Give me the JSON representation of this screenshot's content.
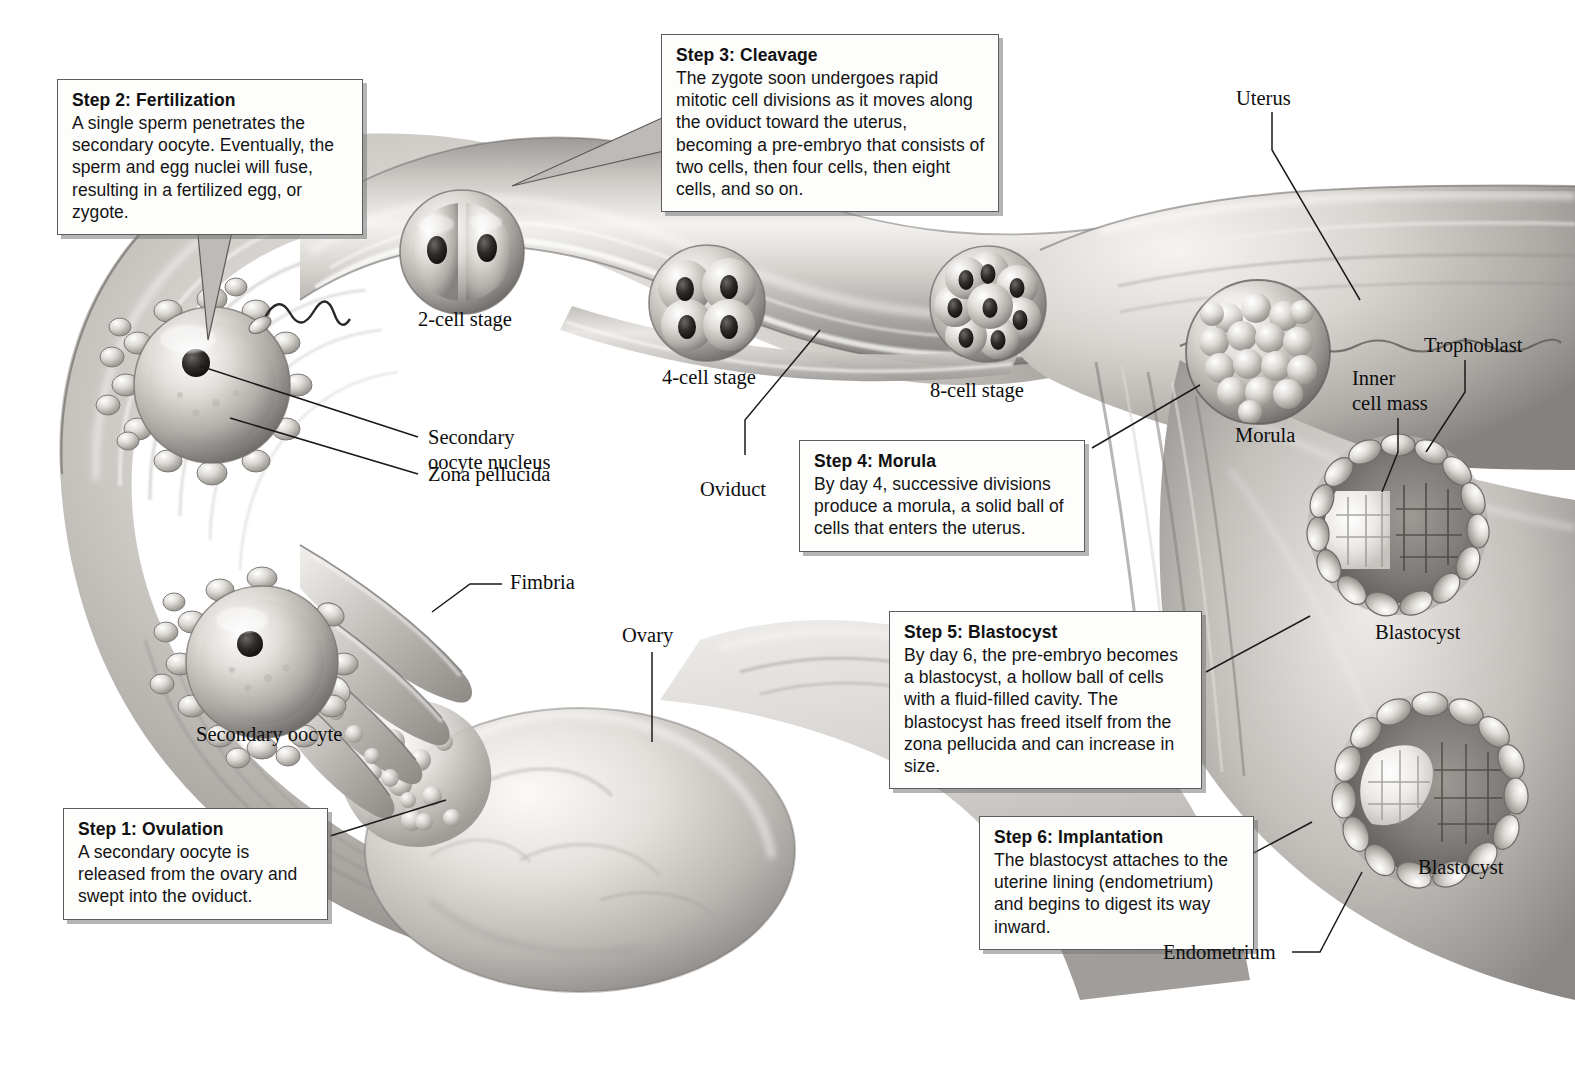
{
  "figure": {
    "type": "anatomical-illustration",
    "style": "grayscale airbrush medical illustration"
  },
  "steps": [
    {
      "id": "step1",
      "title": "Step 1: Ovulation",
      "body": "A secondary oocyte is released from the ovary and swept into the oviduct."
    },
    {
      "id": "step2",
      "title": "Step 2: Fertilization",
      "body": "A single sperm penetrates the secondary oocyte. Eventually, the sperm and egg nuclei will fuse, resulting in a fertilized egg, or zygote."
    },
    {
      "id": "step3",
      "title": "Step 3: Cleavage",
      "body": "The zygote soon undergoes rapid mitotic cell divisions as it moves along the oviduct toward the uterus, becoming a pre-embryo that consists of two cells, then four cells, then eight cells, and so on."
    },
    {
      "id": "step4",
      "title": "Step 4: Morula",
      "body": "By day 4, successive divisions produce a morula, a solid ball of cells that enters the uterus."
    },
    {
      "id": "step5",
      "title": "Step 5: Blastocyst",
      "body": "By day 6, the pre-embryo becomes a blastocyst, a hollow ball of cells with a fluid-filled cavity. The blastocyst has freed itself from the zona pellucida and can increase in size."
    },
    {
      "id": "step6",
      "title": "Step 6: Implantation",
      "body": "The blastocyst attaches to the uterine lining (endometrium) and begins to digest its way inward."
    }
  ],
  "labels": {
    "two_cell": "2-cell stage",
    "four_cell": "4-cell stage",
    "eight_cell": "8-cell stage",
    "secondary_oocyte_nucleus": "Secondary\noocyte nucleus",
    "zona_pellucida": "Zona pellucida",
    "oviduct": "Oviduct",
    "fimbria": "Fimbria",
    "ovary": "Ovary",
    "secondary_oocyte": "Secondary oocyte",
    "uterus": "Uterus",
    "morula": "Morula",
    "trophoblast": "Trophoblast",
    "inner_cell_mass": "Inner\ncell mass",
    "blastocyst_upper": "Blastocyst",
    "blastocyst_lower": "Blastocyst",
    "endometrium": "Endometrium"
  },
  "colors": {
    "page_background": "#ffffff",
    "box_fill": "#fdfdfc",
    "box_border": "#5d5d5d",
    "box_shadow": "#9a9a9a",
    "text": "#111111",
    "leader_line": "#1a1a1a",
    "tissue_light": "#f2f0ee",
    "tissue_mid": "#c9c6c2",
    "tissue_dark": "#8d8a87",
    "tissue_shadow": "#5e5b59"
  }
}
